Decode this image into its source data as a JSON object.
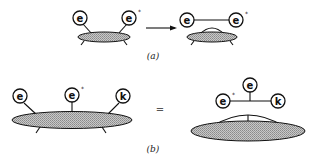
{
  "diagram": {
    "panel_a": {
      "caption": "(a)",
      "left": {
        "nodes": [
          {
            "id": "e",
            "label": "e",
            "superscript": ""
          },
          {
            "id": "e_star",
            "label": "e",
            "superscript": "*"
          }
        ],
        "blob": "hatched-ellipse"
      },
      "operator": "arrow-right",
      "right": {
        "nodes": [
          {
            "id": "e",
            "label": "e",
            "superscript": ""
          },
          {
            "id": "e_star",
            "label": "e",
            "superscript": "*"
          }
        ],
        "connection": "e — e*",
        "blob": "hatched-ellipse-with-arc"
      }
    },
    "panel_b": {
      "caption": "(b)",
      "left": {
        "nodes": [
          {
            "id": "e",
            "label": "e",
            "superscript": ""
          },
          {
            "id": "e_star",
            "label": "e",
            "superscript": "*"
          },
          {
            "id": "k",
            "label": "k",
            "superscript": ""
          }
        ],
        "blob": "hatched-ellipse"
      },
      "operator": "=",
      "right": {
        "nodes": [
          {
            "id": "e_star",
            "label": "e",
            "superscript": "*"
          },
          {
            "id": "e",
            "label": "e",
            "superscript": ""
          },
          {
            "id": "k",
            "label": "k",
            "superscript": ""
          }
        ],
        "connection": "e* — vertex — k, vertex — e",
        "blob": "hatched-ellipse-with-arc-and-stem"
      }
    }
  }
}
